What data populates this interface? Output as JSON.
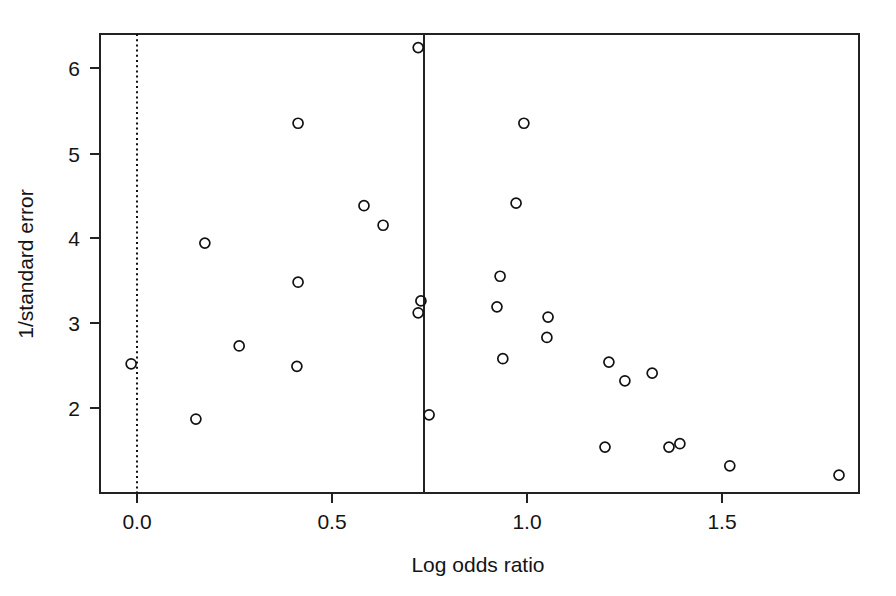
{
  "figure": {
    "name": "funnel-plot",
    "background_color": "#ffffff",
    "ink_color": "#111111"
  },
  "chart_data": {
    "type": "scatter",
    "title": "",
    "subtitle": "",
    "xlabel": "Log odds ratio",
    "ylabel": "1/standard error",
    "xlim": [
      -0.095,
      1.851
    ],
    "ylim": [
      0.999,
      6.396
    ],
    "grid": false,
    "legend": null,
    "xticks": [
      0.0,
      0.5,
      1.0,
      1.5
    ],
    "xticklabels": [
      "0.0",
      "0.5",
      "1.0",
      "1.5"
    ],
    "yticks": [
      2,
      3,
      4,
      5,
      6
    ],
    "yticklabels": [
      "2",
      "3",
      "4",
      "5",
      "6"
    ],
    "marker": "open-circle",
    "marker_radius_px": 5,
    "series": [
      {
        "name": "studies",
        "x": [
          -0.015,
          0.151,
          0.174,
          0.262,
          0.41,
          0.413,
          0.413,
          0.582,
          0.631,
          0.721,
          0.721,
          0.728,
          0.749,
          0.923,
          0.931,
          0.938,
          0.972,
          0.992,
          1.051,
          1.054,
          1.2,
          1.21,
          1.251,
          1.321,
          1.364,
          1.392,
          1.52,
          1.8
        ],
        "y": [
          2.52,
          1.87,
          3.94,
          2.73,
          2.49,
          3.48,
          5.35,
          4.38,
          4.15,
          3.12,
          6.24,
          3.26,
          1.92,
          3.19,
          3.55,
          2.58,
          4.41,
          5.35,
          2.83,
          3.07,
          1.54,
          2.54,
          2.32,
          2.41,
          1.54,
          1.58,
          1.32,
          1.21
        ]
      }
    ],
    "reference_lines": [
      {
        "name": "null-effect-line",
        "orientation": "vertical",
        "value": 0.0,
        "style": "dotted"
      },
      {
        "name": "pooled-estimate-line",
        "orientation": "vertical",
        "value": 0.736,
        "style": "solid"
      }
    ]
  }
}
